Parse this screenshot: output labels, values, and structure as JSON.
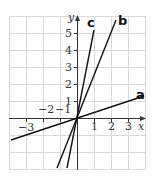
{
  "diagram": {
    "type": "coordinate-plane-lines",
    "x_axis": {
      "label": "x",
      "ticks": [
        "-3",
        "-2",
        "-1",
        "1",
        "2",
        "3"
      ]
    },
    "y_axis": {
      "label": "y",
      "ticks": [
        "1",
        "2",
        "3",
        "4",
        "5"
      ]
    },
    "lines": [
      {
        "label": "a",
        "slope_approx": 0.33
      },
      {
        "label": "b",
        "slope_approx": 2.5
      },
      {
        "label": "c",
        "slope_approx": 5
      }
    ],
    "colors": {
      "grid": "#d9d9d9",
      "axis": "#333333",
      "line": "#111111"
    }
  }
}
